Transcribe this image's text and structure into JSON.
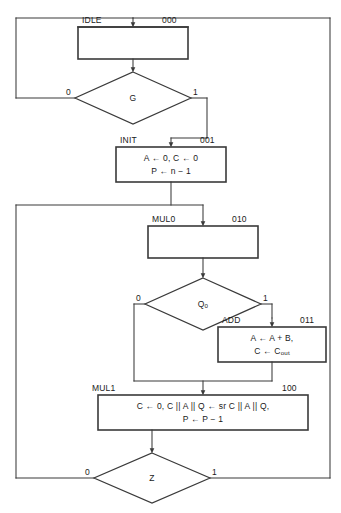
{
  "diagram": {
    "type": "asm-chart",
    "colors": {
      "line": "#3a3a3a",
      "box_border": "#3a3a3a",
      "text": "#1a1a1a",
      "background": "#ffffff"
    },
    "states": [
      {
        "id": "idle",
        "name": "IDLE",
        "code": "000",
        "body_lines": []
      },
      {
        "id": "init",
        "name": "INIT",
        "code": "001",
        "body_lines": [
          "A ← 0, C ← 0",
          "P ← n − 1"
        ]
      },
      {
        "id": "mul0",
        "name": "MUL0",
        "code": "010",
        "body_lines": []
      },
      {
        "id": "add",
        "name": "ADD",
        "code": "011",
        "body_lines": [
          "A ← A + B,",
          "C ← C_out"
        ]
      },
      {
        "id": "mul1",
        "name": "MUL1",
        "code": "100",
        "body_lines": [
          "C ← 0, C || A || Q ← sr C || A || Q,",
          "P ← P − 1"
        ]
      }
    ],
    "decisions": [
      {
        "id": "g",
        "condition": "G",
        "false_label": "0",
        "true_label": "1"
      },
      {
        "id": "q0",
        "condition": "Q_0",
        "false_label": "0",
        "true_label": "1"
      },
      {
        "id": "z",
        "condition": "Z",
        "false_label": "0",
        "true_label": "1"
      }
    ]
  }
}
